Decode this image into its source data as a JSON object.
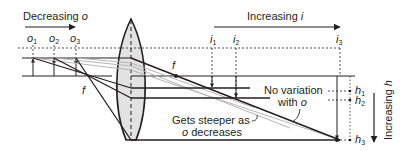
{
  "labels": {
    "decreasing_o": "Decreasing ",
    "decreasing_o_var": "o",
    "increasing_i": "Increasing ",
    "increasing_i_var": "i",
    "increasing_h": "Increasing ",
    "increasing_h_var": "h",
    "no_variation_line1": "No variation",
    "no_variation_line2": "with ",
    "no_variation_var": "o",
    "steeper_line1": "Gets steeper as",
    "steeper_line2_var": "o",
    "steeper_line2": " decreases",
    "focal_left": "f",
    "focal_right": "f"
  },
  "object_positions": [
    {
      "var": "o",
      "sub": "1"
    },
    {
      "var": "o",
      "sub": "2"
    },
    {
      "var": "o",
      "sub": "3"
    }
  ],
  "image_positions": [
    {
      "var": "i",
      "sub": "1"
    },
    {
      "var": "i",
      "sub": "2"
    },
    {
      "var": "i",
      "sub": "3"
    }
  ],
  "heights": [
    {
      "var": "h",
      "sub": "1"
    },
    {
      "var": "h",
      "sub": "2"
    },
    {
      "var": "h",
      "sub": "3"
    }
  ],
  "colors": {
    "line": "#231f20",
    "lens_fill": "#e2e2e3",
    "gray_ray": "#b5b5b5"
  }
}
